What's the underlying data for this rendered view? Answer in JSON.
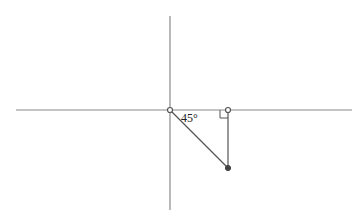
{
  "diagram": {
    "type": "geometry-right-triangle",
    "colors": {
      "axis": "#8a8a8a",
      "segment": "#555555",
      "point_fill": "#444444",
      "open_point_stroke": "#555555",
      "background": "#ffffff"
    },
    "axes": {
      "horizontal": {
        "x1": 16,
        "y1": 110,
        "x2": 352,
        "y2": 110
      },
      "vertical": {
        "x1": 170,
        "y1": 16,
        "x2": 170,
        "y2": 210
      }
    },
    "points": [
      {
        "name": "origin",
        "x": 170,
        "y": 110,
        "style": "open"
      },
      {
        "name": "foot",
        "x": 228,
        "y": 110,
        "style": "open"
      },
      {
        "name": "endpoint",
        "x": 228,
        "y": 168,
        "style": "filled"
      }
    ],
    "segments": [
      {
        "name": "hypotenuse",
        "from": "origin",
        "to": "endpoint"
      },
      {
        "name": "vertical-leg",
        "from": "foot",
        "to": "endpoint"
      }
    ],
    "angle_label": "45°",
    "right_angle_marker": {
      "at": "foot",
      "size": 8
    }
  }
}
